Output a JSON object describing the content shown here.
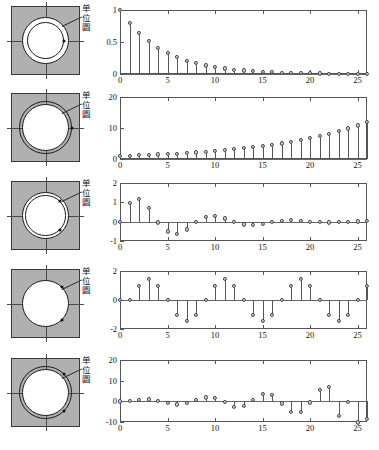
{
  "figure": {
    "unit_circle_label": "单位圆",
    "label_chars": [
      "单",
      "位",
      "圆"
    ]
  },
  "chart_data": [
    {
      "type": "stem",
      "title": "",
      "xlabel": "",
      "ylabel": "",
      "xlim": [
        0,
        26
      ],
      "ylim": [
        0,
        1
      ],
      "yticks": [
        0,
        0.5,
        1
      ],
      "ytick_labels": [
        "0",
        "0.5",
        "1"
      ],
      "xticks": [
        0,
        5,
        10,
        15,
        20,
        25
      ],
      "xtick_labels": [
        "0",
        "5",
        "10",
        "15",
        "20",
        "25"
      ],
      "grid": false,
      "x": [
        0,
        1,
        2,
        3,
        4,
        5,
        6,
        7,
        8,
        9,
        10,
        11,
        12,
        13,
        14,
        15,
        16,
        17,
        18,
        19,
        20,
        21,
        22,
        23,
        24,
        25,
        26
      ],
      "values": [
        1,
        0.8,
        0.64,
        0.512,
        0.41,
        0.328,
        0.262,
        0.21,
        0.168,
        0.134,
        0.107,
        0.086,
        0.069,
        0.055,
        0.044,
        0.035,
        0.028,
        0.023,
        0.018,
        0.014,
        0.012,
        0.009,
        0.007,
        0.006,
        0.005,
        0.004,
        0.003
      ],
      "pole_radius": 0.8,
      "pole_type": "real-inside",
      "description": "decaying exponential, pole inside unit circle"
    },
    {
      "type": "stem",
      "title": "",
      "xlabel": "",
      "ylabel": "",
      "xlim": [
        0,
        26
      ],
      "ylim": [
        0,
        20
      ],
      "yticks": [
        0,
        10,
        20
      ],
      "ytick_labels": [
        "0",
        "10",
        "20"
      ],
      "xticks": [
        0,
        5,
        10,
        15,
        20,
        25
      ],
      "xtick_labels": [
        "0",
        "5",
        "10",
        "15",
        "20",
        "25"
      ],
      "grid": false,
      "x": [
        0,
        1,
        2,
        3,
        4,
        5,
        6,
        7,
        8,
        9,
        10,
        11,
        12,
        13,
        14,
        15,
        16,
        17,
        18,
        19,
        20,
        21,
        22,
        23,
        24,
        25,
        26
      ],
      "values": [
        1,
        1.1,
        1.21,
        1.33,
        1.46,
        1.61,
        1.77,
        1.95,
        2.14,
        2.36,
        2.59,
        2.85,
        3.14,
        3.45,
        3.8,
        4.18,
        4.59,
        5.05,
        5.56,
        6.12,
        6.73,
        7.4,
        8.14,
        8.95,
        9.85,
        10.83,
        11.92
      ],
      "pole_radius": 1.1,
      "pole_type": "real-outside",
      "description": "growing exponential, pole outside unit circle"
    },
    {
      "type": "stem",
      "title": "",
      "xlabel": "",
      "ylabel": "",
      "xlim": [
        0,
        26
      ],
      "ylim": [
        -1,
        2
      ],
      "yticks": [
        -1,
        0,
        1,
        2
      ],
      "ytick_labels": [
        "-1",
        "0",
        "1",
        "2"
      ],
      "xticks": [
        0,
        5,
        10,
        15,
        20,
        25
      ],
      "xtick_labels": [
        "0",
        "5",
        "10",
        "15",
        "20",
        "25"
      ],
      "grid": false,
      "x": [
        0,
        1,
        2,
        3,
        4,
        5,
        6,
        7,
        8,
        9,
        10,
        11,
        12,
        13,
        14,
        15,
        16,
        17,
        18,
        19,
        20,
        21,
        22,
        23,
        24,
        25,
        26
      ],
      "values": [
        0,
        0.95,
        1.18,
        0.7,
        -0.04,
        -0.5,
        -0.62,
        -0.4,
        -0.02,
        0.26,
        0.3,
        0.17,
        0.0,
        -0.14,
        -0.16,
        -0.1,
        0.0,
        0.06,
        0.08,
        0.04,
        0.0,
        -0.03,
        -0.04,
        -0.02,
        0.0,
        0.01,
        0.02
      ],
      "pole_radius": 0.8,
      "pole_type": "complex-inside",
      "description": "decaying oscillation, complex pole pair inside unit circle"
    },
    {
      "type": "stem",
      "title": "",
      "xlabel": "",
      "ylabel": "",
      "xlim": [
        0,
        26
      ],
      "ylim": [
        -2,
        2
      ],
      "yticks": [
        -2,
        0,
        2
      ],
      "ytick_labels": [
        "-2",
        "0",
        "2"
      ],
      "xticks": [
        0,
        5,
        10,
        15,
        20,
        25
      ],
      "xtick_labels": [
        "0",
        "5",
        "10",
        "15",
        "20",
        "25"
      ],
      "grid": false,
      "x": [
        0,
        1,
        2,
        3,
        4,
        5,
        6,
        7,
        8,
        9,
        10,
        11,
        12,
        13,
        14,
        15,
        16,
        17,
        18,
        19,
        20,
        21,
        22,
        23,
        24,
        25,
        26
      ],
      "values": [
        0,
        0,
        1.0,
        1.45,
        1.0,
        0,
        -1.0,
        -1.45,
        -1.0,
        0,
        1.0,
        1.45,
        1.0,
        0,
        -1.0,
        -1.45,
        -1.0,
        0,
        1.0,
        1.45,
        1.0,
        0,
        -1.0,
        -1.45,
        -1.0,
        0,
        1.0
      ],
      "pole_radius": 1.0,
      "pole_type": "complex-on-circle",
      "description": "sustained oscillation, complex pole pair on unit circle"
    },
    {
      "type": "stem",
      "title": "",
      "xlabel": "",
      "ylabel": "",
      "xlim": [
        0,
        26
      ],
      "ylim": [
        -10,
        20
      ],
      "yticks": [
        -10,
        0,
        10,
        20
      ],
      "ytick_labels": [
        "-10",
        "0",
        "10",
        "20"
      ],
      "xticks": [
        0,
        5,
        10,
        15,
        20,
        25
      ],
      "xtick_labels": [
        "0",
        "5",
        "10",
        "15",
        "20",
        "25"
      ],
      "grid": false,
      "x": [
        0,
        1,
        2,
        3,
        4,
        5,
        6,
        7,
        8,
        9,
        10,
        11,
        12,
        13,
        14,
        15,
        16,
        17,
        18,
        19,
        20,
        21,
        22,
        23,
        24,
        25,
        26
      ],
      "values": [
        0,
        0.2,
        0.8,
        0.9,
        0.2,
        -0.9,
        -1.5,
        -0.8,
        0.6,
        1.9,
        1.7,
        -0.3,
        -2.6,
        -2.2,
        0.8,
        3.6,
        3.3,
        -1.0,
        -5.2,
        -5.0,
        -0.5,
        5.4,
        6.8,
        -7.2,
        -0.4,
        -10.2,
        -8.5
      ],
      "pole_radius": 1.1,
      "pole_type": "complex-outside",
      "description": "growing oscillation, complex pole pair outside unit circle"
    }
  ],
  "zplanes": [
    {
      "name": "z-plane-1",
      "unit_circle": true,
      "extra_circle": 0.8,
      "poles": [
        {
          "x": 0.8,
          "y": 0
        }
      ]
    },
    {
      "name": "z-plane-2",
      "unit_circle": true,
      "extra_circle": 1.12,
      "poles": [
        {
          "x": 1.12,
          "y": 0
        }
      ]
    },
    {
      "name": "z-plane-3",
      "unit_circle": true,
      "extra_circle": 0.86,
      "poles": [
        {
          "x": 0.62,
          "y": 0.6
        },
        {
          "x": 0.62,
          "y": -0.6
        }
      ]
    },
    {
      "name": "z-plane-4",
      "unit_circle": true,
      "extra_circle": 0,
      "poles": [
        {
          "x": 0.71,
          "y": 0.71
        },
        {
          "x": 0.71,
          "y": -0.71
        }
      ]
    },
    {
      "name": "z-plane-5",
      "unit_circle": true,
      "extra_circle": 1.12,
      "poles": [
        {
          "x": 0.8,
          "y": 0.78
        },
        {
          "x": 0.8,
          "y": -0.78
        }
      ]
    }
  ]
}
